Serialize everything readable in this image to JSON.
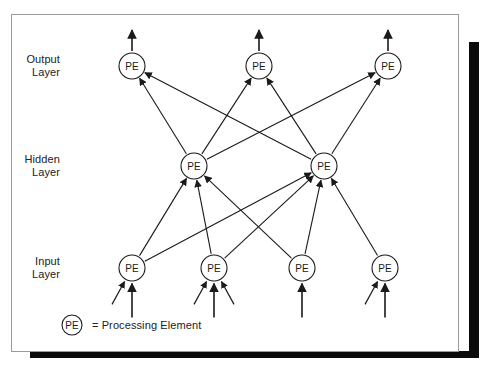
{
  "figure": {
    "background_color": "#ffffff",
    "card_border_color": "#9a9a9a",
    "ink_color": "#1a1a1a",
    "shadow_color": "#0a0a0a"
  },
  "layers": [
    {
      "id": "output",
      "label": "Output\nLayer",
      "label_x": 60,
      "label_y": 53,
      "node_y": 66
    },
    {
      "id": "hidden",
      "label": "Hidden\nLayer",
      "label_x": 60,
      "label_y": 153,
      "node_y": 166
    },
    {
      "id": "input",
      "label": "Input\nLayer",
      "label_x": 60,
      "label_y": 255,
      "node_y": 268
    }
  ],
  "node_label": "PE",
  "node_radius": 13,
  "nodes": {
    "output": [
      {
        "id": "o1",
        "x": 132,
        "y": 66
      },
      {
        "id": "o2",
        "x": 259,
        "y": 66
      },
      {
        "id": "o3",
        "x": 388,
        "y": 66
      }
    ],
    "hidden": [
      {
        "id": "h1",
        "x": 194,
        "y": 166
      },
      {
        "id": "h2",
        "x": 324,
        "y": 166
      }
    ],
    "input": [
      {
        "id": "i1",
        "x": 132,
        "y": 268
      },
      {
        "id": "i2",
        "x": 214,
        "y": 268
      },
      {
        "id": "i3",
        "x": 302,
        "y": 268
      },
      {
        "id": "i4",
        "x": 385,
        "y": 268
      }
    ]
  },
  "edges": {
    "hidden_to_output": [
      {
        "from": "h1",
        "to": "o1"
      },
      {
        "from": "h1",
        "to": "o2"
      },
      {
        "from": "h1",
        "to": "o3"
      },
      {
        "from": "h2",
        "to": "o1"
      },
      {
        "from": "h2",
        "to": "o2"
      },
      {
        "from": "h2",
        "to": "o3"
      }
    ],
    "input_to_hidden": [
      {
        "from": "i1",
        "to": "h1"
      },
      {
        "from": "i1",
        "to": "h2"
      },
      {
        "from": "i2",
        "to": "h1"
      },
      {
        "from": "i2",
        "to": "h2"
      },
      {
        "from": "i3",
        "to": "h1"
      },
      {
        "from": "i3",
        "to": "h2"
      },
      {
        "from": "i4",
        "to": "h2"
      }
    ]
  },
  "external_inputs": [
    {
      "node": "i1",
      "arrows": [
        {
          "dx": 0,
          "dy": 1
        },
        {
          "dx": -0.55,
          "dy": 1
        }
      ]
    },
    {
      "node": "i2",
      "arrows": [
        {
          "dx": 0,
          "dy": 1
        },
        {
          "dx": 0.55,
          "dy": 1
        },
        {
          "dx": -0.55,
          "dy": 1
        }
      ]
    },
    {
      "node": "i3",
      "arrows": [
        {
          "dx": 0,
          "dy": 1
        }
      ]
    },
    {
      "node": "i4",
      "arrows": [
        {
          "dx": 0,
          "dy": 1
        },
        {
          "dx": -0.55,
          "dy": 1
        }
      ]
    }
  ],
  "external_outputs": [
    {
      "node": "o1"
    },
    {
      "node": "o2"
    },
    {
      "node": "o3"
    }
  ],
  "legend": {
    "symbol_label": "PE",
    "text": "= Processing Element"
  }
}
